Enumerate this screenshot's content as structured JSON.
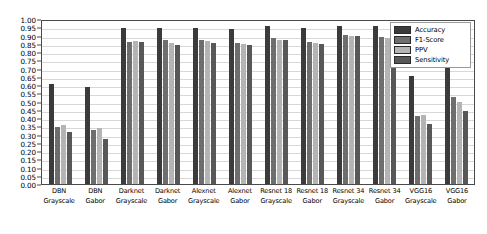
{
  "chart_data": {
    "type": "bar",
    "title": "",
    "xlabel": "",
    "ylabel": "",
    "ylim": [
      0.0,
      1.0
    ],
    "ytick_step": 0.05,
    "grid": true,
    "legend_position": "top-right",
    "yticks": [
      "1.00",
      "0.95",
      "0.90",
      "0.85",
      "0.80",
      "0.75",
      "0.70",
      "0.65",
      "0.60",
      "0.55",
      "0.50",
      "0.45",
      "0.40",
      "0.35",
      "0.30",
      "0.25",
      "0.20",
      "0.15",
      "0.10",
      "0.05",
      "0.00"
    ],
    "ytick_values": [
      1.0,
      0.95,
      0.9,
      0.85,
      0.8,
      0.75,
      0.7,
      0.65,
      0.6,
      0.55,
      0.5,
      0.45,
      0.4,
      0.35,
      0.3,
      0.25,
      0.2,
      0.15,
      0.1,
      0.05,
      0.0
    ],
    "categories": [
      {
        "line1": "DBN",
        "line2": "Grayscale"
      },
      {
        "line1": "DBN",
        "line2": "Gabor"
      },
      {
        "line1": "Darknet",
        "line2": "Grayscale"
      },
      {
        "line1": "Darknet",
        "line2": "Gabor"
      },
      {
        "line1": "Alexnet",
        "line2": "Grayscale"
      },
      {
        "line1": "Alexnet",
        "line2": "Gabor"
      },
      {
        "line1": "Resnet 18",
        "line2": "Grayscale"
      },
      {
        "line1": "Resnet 18",
        "line2": "Gabor"
      },
      {
        "line1": "Resnet 34",
        "line2": "Grayscale"
      },
      {
        "line1": "Resnet 34",
        "line2": "Gabor"
      },
      {
        "line1": "VGG16",
        "line2": "Grayscale"
      },
      {
        "line1": "VGG16",
        "line2": "Gabor"
      }
    ],
    "series": [
      {
        "name": "Accuracy",
        "color": "#3b3b3b",
        "values": [
          0.605,
          0.585,
          0.945,
          0.945,
          0.945,
          0.94,
          0.955,
          0.945,
          0.96,
          0.955,
          0.655,
          0.72
        ]
      },
      {
        "name": "F1-Score",
        "color": "#6e6e6e",
        "values": [
          0.345,
          0.325,
          0.86,
          0.875,
          0.875,
          0.855,
          0.885,
          0.86,
          0.905,
          0.89,
          0.41,
          0.525
        ]
      },
      {
        "name": "PPV",
        "color": "#b4b4b4",
        "values": [
          0.355,
          0.34,
          0.865,
          0.855,
          0.865,
          0.85,
          0.875,
          0.855,
          0.9,
          0.885,
          0.42,
          0.5
        ]
      },
      {
        "name": "Sensitivity",
        "color": "#585858",
        "values": [
          0.315,
          0.275,
          0.86,
          0.845,
          0.855,
          0.845,
          0.87,
          0.85,
          0.895,
          0.88,
          0.365,
          0.445
        ]
      }
    ]
  }
}
